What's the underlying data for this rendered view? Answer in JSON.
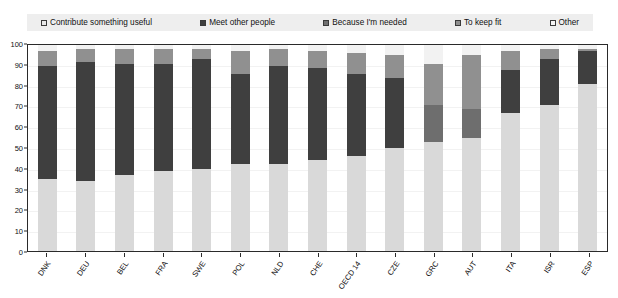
{
  "legend": {
    "position": "top",
    "items": [
      {
        "label": "Contribute something useful",
        "color": "#e8e8e8",
        "icon": "square-swatch"
      },
      {
        "label": "Meet other people",
        "color": "#3f3f3f",
        "icon": "square-swatch"
      },
      {
        "label": "Because I'm needed",
        "color": "#707070",
        "icon": "square-swatch"
      },
      {
        "label": "To keep fit",
        "color": "#8f8f8f",
        "icon": "square-swatch"
      },
      {
        "label": "Other",
        "color": "#f5f5f5",
        "icon": "square-swatch"
      }
    ]
  },
  "chart_data": {
    "type": "bar",
    "subtype": "stacked-vertical-100",
    "title": "",
    "xlabel": "",
    "ylabel": "",
    "ylim": [
      0,
      100
    ],
    "yticks": [
      0,
      10,
      20,
      30,
      40,
      50,
      60,
      70,
      80,
      90,
      100
    ],
    "grid": true,
    "categories": [
      "DNK",
      "DEU",
      "BEL",
      "FRA",
      "SWE",
      "POL",
      "NLD",
      "CHE",
      "OECD 14",
      "CZE",
      "GRC",
      "AUT",
      "ITA",
      "ISR",
      "ESP"
    ],
    "series": [
      {
        "name": "Contribute something useful",
        "color": "#d9d9d9",
        "values": [
          35,
          34,
          37,
          39,
          40,
          42,
          42,
          44,
          46,
          50,
          53,
          55,
          67,
          71,
          81
        ]
      },
      {
        "name": "Meet other people",
        "color": "#3f3f3f",
        "values": [
          55,
          58,
          54,
          52,
          53,
          44,
          48,
          45,
          40,
          34,
          0,
          0,
          21,
          22,
          16
        ]
      },
      {
        "name": "Because I'm needed",
        "color": "#6e6e6e",
        "values": [
          0,
          0,
          0,
          0,
          0,
          0,
          0,
          0,
          0,
          0,
          18,
          14,
          0,
          0,
          0
        ]
      },
      {
        "name": "To keep fit",
        "color": "#909090",
        "values": [
          7,
          6,
          7,
          7,
          5,
          11,
          8,
          8,
          10,
          11,
          20,
          26,
          9,
          5,
          1
        ]
      },
      {
        "name": "Other",
        "color": "#f2f2f2",
        "values": [
          3,
          2,
          2,
          2,
          2,
          3,
          2,
          3,
          4,
          5,
          9,
          5,
          3,
          2,
          2
        ]
      }
    ]
  }
}
